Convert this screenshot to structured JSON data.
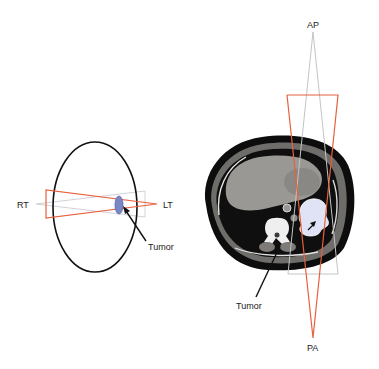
{
  "left_diagram": {
    "labels": {
      "right": "RT",
      "left": "LT",
      "tumor": "Tumor"
    },
    "colors": {
      "outline": "#111111",
      "beam_red": "#e8603c",
      "beam_grey": "#c9c9c9",
      "tumor_fill": "#7b86c4",
      "tumor_stroke": "#5a64a8"
    }
  },
  "right_diagram": {
    "labels": {
      "anterior": "AP",
      "posterior": "PA",
      "tumor": "Tumor"
    },
    "colors": {
      "beam_red": "#e8603c",
      "beam_grey": "#c4c4c4",
      "ct_body_outer": "#0d0d0d",
      "ct_soft_tissue": "#8f8d8a",
      "ct_liver": "#9a9894",
      "ct_lung": "#141414",
      "ct_bone": "#efefef",
      "tumor_highlight": "#dfe3f5"
    }
  }
}
